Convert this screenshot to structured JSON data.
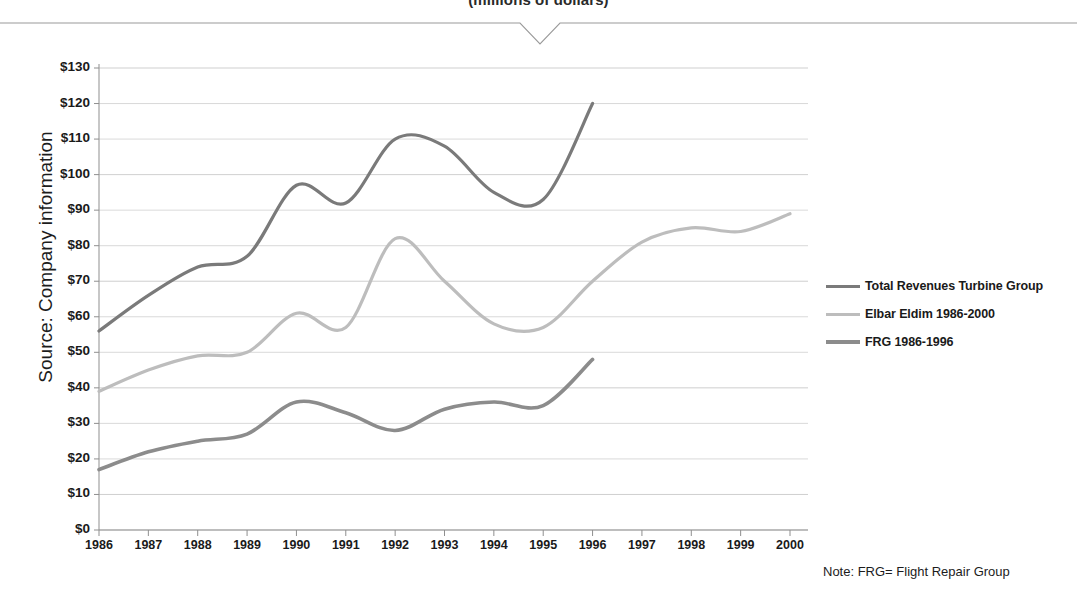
{
  "title": "(millions of dollars)",
  "source_label": "Source: Company information",
  "footnote": "Note: FRG= Flight Repair Group",
  "legend": {
    "items": [
      {
        "label": "Total Revenues Turbine Group",
        "color": "#7a7a7a"
      },
      {
        "label": "Elbar Eldim 1986-2000",
        "color": "#bdbdbd"
      },
      {
        "label": "FRG 1986-1996",
        "color": "#8c8c8c"
      }
    ]
  },
  "chart_data": {
    "type": "line",
    "title": "(millions of dollars)",
    "xlabel": "",
    "ylabel": "",
    "ylim": [
      0,
      130
    ],
    "ytick_step": 10,
    "grid": true,
    "legend_position": "right",
    "categories": [
      "1986",
      "1987",
      "1988",
      "1989",
      "1990",
      "1991",
      "1992",
      "1993",
      "1994",
      "1995",
      "1996",
      "1997",
      "1998",
      "1999",
      "2000"
    ],
    "ytick_labels": [
      "$130",
      "$120",
      "$110",
      "$100",
      "$90",
      "$80",
      "$70",
      "$60",
      "$50",
      "$40",
      "$30",
      "$20",
      "$10",
      "$0"
    ],
    "series": [
      {
        "name": "Total Revenues Turbine Group",
        "color": "#7a7a7a",
        "width": 3.2,
        "x": [
          "1986",
          "1987",
          "1988",
          "1989",
          "1990",
          "1991",
          "1992",
          "1993",
          "1994",
          "1995",
          "1996"
        ],
        "values": [
          56,
          66,
          74,
          77,
          97,
          92,
          110,
          108,
          95,
          93,
          120
        ]
      },
      {
        "name": "Elbar Eldim 1986-2000",
        "color": "#bdbdbd",
        "width": 3.2,
        "x": [
          "1986",
          "1987",
          "1988",
          "1989",
          "1990",
          "1991",
          "1992",
          "1993",
          "1994",
          "1995",
          "1996",
          "1997",
          "1998",
          "1999",
          "2000"
        ],
        "values": [
          39,
          45,
          49,
          50,
          61,
          57,
          82,
          70,
          58,
          57,
          70,
          81,
          85,
          84,
          89
        ]
      },
      {
        "name": "FRG 1986-1996",
        "color": "#8c8c8c",
        "width": 3.6,
        "x": [
          "1986",
          "1987",
          "1988",
          "1989",
          "1990",
          "1991",
          "1992",
          "1993",
          "1994",
          "1995",
          "1996"
        ],
        "values": [
          17,
          22,
          25,
          27,
          36,
          33,
          28,
          34,
          36,
          35,
          48
        ]
      }
    ]
  }
}
